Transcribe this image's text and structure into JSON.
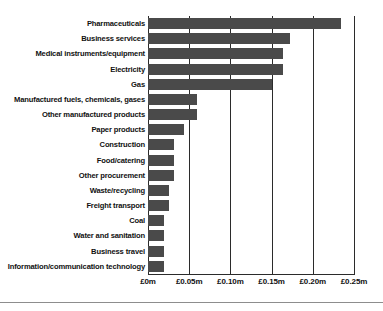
{
  "chart_data": {
    "type": "bar",
    "orientation": "horizontal",
    "title": "",
    "subtitle": "",
    "xlabel": "",
    "ylabel": "",
    "xlim": [
      0,
      0.25
    ],
    "grid": true,
    "legend": null,
    "currency": "GBP",
    "units": "millions",
    "categories": [
      "Pharmaceuticals",
      "Business services",
      "Medical instruments/equipment",
      "Electricity",
      "Gas",
      "Manufactured fuels, chemicals, gases",
      "Other manufactured products",
      "Paper products",
      "Construction",
      "Food/catering",
      "Other procurement",
      "Waste/recycling",
      "Freight transport",
      "Coal",
      "Water and sanitation",
      "Business travel",
      "Information/communication technology"
    ],
    "values": [
      0.234,
      0.172,
      0.164,
      0.164,
      0.15,
      0.059,
      0.059,
      0.044,
      0.032,
      0.032,
      0.032,
      0.025,
      0.025,
      0.019,
      0.019,
      0.019,
      0.019
    ],
    "xticks": [
      0,
      0.05,
      0.1,
      0.15,
      0.2,
      0.25
    ],
    "xtick_labels": [
      "£0m",
      "£0.05m",
      "£0.10m",
      "£0.15m",
      "£0.20m",
      "£0.25m"
    ],
    "colors": {
      "bar": "#4a4a4a",
      "axis": "#2b2b2b",
      "text": "#111111",
      "background": "#ffffff",
      "rule": "#8d8d8d"
    }
  }
}
